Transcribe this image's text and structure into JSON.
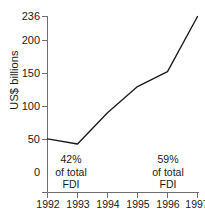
{
  "chart_data": {
    "type": "line",
    "title": "",
    "subtitle": "",
    "xlabel": "",
    "ylabel": "US$ billions",
    "categories": [
      "1992",
      "1993",
      "1994",
      "1995",
      "1996",
      "1997"
    ],
    "x": [
      1992,
      1993,
      1994,
      1995,
      1996,
      1997
    ],
    "values": [
      72,
      65,
      107,
      142,
      162,
      236
    ],
    "series": [
      {
        "name": "FDI inflows to developing countries",
        "values": [
          72,
          65,
          107,
          142,
          162,
          236
        ]
      }
    ],
    "ylim": [
      0,
      236
    ],
    "xlim": [
      1992,
      1997
    ],
    "yticks": [
      0,
      50,
      100,
      150,
      200,
      236
    ],
    "ytick_labels": [
      "0",
      "50",
      "100",
      "150",
      "200",
      "236"
    ],
    "xticks": [
      1992,
      1993,
      1994,
      1995,
      1996,
      1997
    ],
    "xtick_labels": [
      "1992",
      "1993",
      "1994",
      "1995",
      "1996",
      "1997"
    ],
    "grid": false,
    "legend": false,
    "legend_position": "none",
    "line_color": "#1a1a1a",
    "background_color": "#ffffff",
    "axis_color": "#6e6e6e",
    "annotations": [
      {
        "id": "left",
        "at_x": 1993,
        "lines": [
          "42%",
          "of total",
          "FDI"
        ],
        "text": "42% of total FDI"
      },
      {
        "id": "right",
        "at_x": 1997,
        "lines": [
          "59%",
          "of total",
          "FDI"
        ],
        "text": "59% of total FDI"
      }
    ]
  }
}
